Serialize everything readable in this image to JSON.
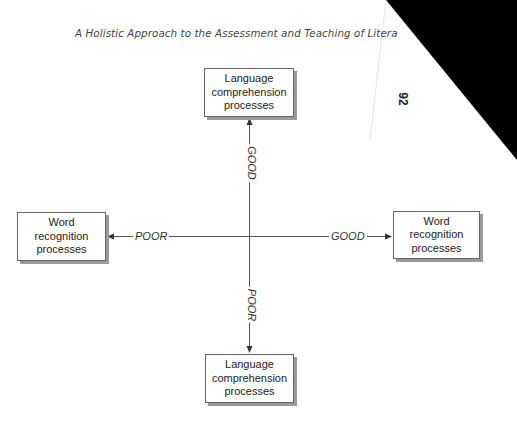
{
  "page": {
    "running_head": "A Holistic Approach to the Assessment and Teaching of Litera",
    "page_number": "92"
  },
  "diagram": {
    "type": "quadrant-axes",
    "top_box": {
      "lines": [
        "Language",
        "comprehension",
        "processes"
      ]
    },
    "bottom_box": {
      "lines": [
        "Language",
        "comprehension",
        "processes"
      ]
    },
    "left_box": {
      "lines": [
        "Word",
        "recognition",
        "processes"
      ]
    },
    "right_box": {
      "lines": [
        "Word",
        "recognition",
        "processes"
      ]
    },
    "axis_labels": {
      "vertical_up": "GOOD",
      "vertical_down": "POOR",
      "horizontal_left": "POOR",
      "horizontal_right": "GOOD"
    },
    "colors": {
      "line": "#555555",
      "box_border": "#666666",
      "box_shadow": "#9a9a9a",
      "corner_fill": "#000000"
    }
  }
}
